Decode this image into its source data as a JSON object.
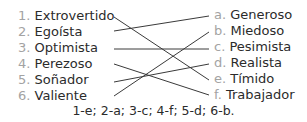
{
  "left_items": [
    {
      "num": "1.",
      "label": "Extrovertido"
    },
    {
      "num": "2.",
      "label": "Egoísta"
    },
    {
      "num": "3.",
      "label": "Optimista"
    },
    {
      "num": "4.",
      "label": "Perezoso"
    },
    {
      "num": "5.",
      "label": "Soñador"
    },
    {
      "num": "6.",
      "label": "Valiente"
    }
  ],
  "right_items": [
    {
      "letter": "a.",
      "label": "Generoso"
    },
    {
      "letter": "b.",
      "label": "Miedoso"
    },
    {
      "letter": "c.",
      "label": "Pesimista"
    },
    {
      "letter": "d.",
      "label": "Realista"
    },
    {
      "letter": "e.",
      "label": "Tímido"
    },
    {
      "letter": "f.",
      "label": " Trabajador"
    }
  ],
  "matches": [
    {
      "left": 1,
      "right": "e"
    },
    {
      "left": 2,
      "right": "a"
    },
    {
      "left": 3,
      "right": "c"
    },
    {
      "left": 4,
      "right": "f"
    },
    {
      "left": 5,
      "right": "d"
    },
    {
      "left": 6,
      "right": "b"
    }
  ],
  "answer_key": "1-e; 2-a; 3-c; 4-f; 5-d; 6-b.",
  "colors": {
    "number": "#a3a3a3",
    "text": "#2b2b2b",
    "line": "#3a3a3a"
  }
}
